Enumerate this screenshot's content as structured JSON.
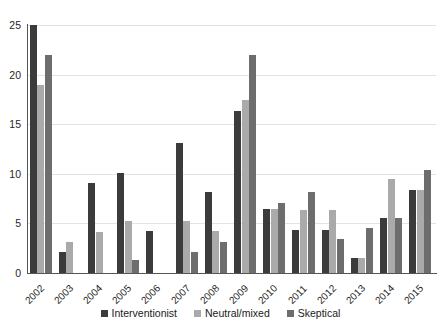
{
  "chart_data": {
    "type": "bar",
    "title": "",
    "xlabel": "",
    "ylabel": "",
    "ylim": [
      0,
      25
    ],
    "yticks": [
      0,
      5,
      10,
      15,
      20,
      25
    ],
    "grid": true,
    "legend_position": "bottom",
    "categories": [
      "2002",
      "2003",
      "2004",
      "2005",
      "2006",
      "2007",
      "2008",
      "2009",
      "2010",
      "2011",
      "2012",
      "2013",
      "2014",
      "2015"
    ],
    "series": [
      {
        "name": "Interventionist",
        "color": "#3b3b3b",
        "values": [
          25,
          2.1,
          9.1,
          10.1,
          4.2,
          13.1,
          8.2,
          16.3,
          6.5,
          4.3,
          4.3,
          1.5,
          5.5,
          8.4
        ]
      },
      {
        "name": "Neutral/mixed",
        "color": "#aaaaaa",
        "values": [
          19,
          3.1,
          4.1,
          5.2,
          0,
          5.2,
          4.2,
          17.4,
          6.5,
          6.4,
          6.4,
          1.5,
          9.5,
          8.4
        ]
      },
      {
        "name": "Skeptical",
        "color": "#6d6d6d",
        "values": [
          22,
          0,
          0,
          1.3,
          0,
          2.1,
          3.1,
          22,
          7.1,
          8.2,
          3.4,
          4.5,
          5.5,
          10.4
        ]
      }
    ]
  }
}
